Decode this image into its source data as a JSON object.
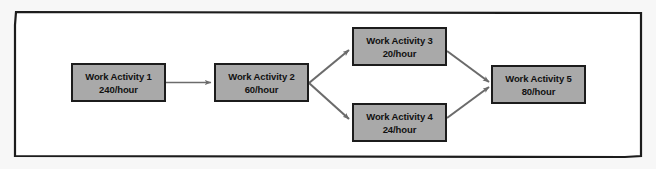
{
  "diagram": {
    "frame": {
      "shape": "chamfered-rectangle",
      "border_color": "#1c1c1c",
      "background_color": "#ffffff",
      "page_background_color": "#f7f7f7"
    },
    "style": {
      "node_fill": "#a9a9a9",
      "node_border": "#1c1c1c",
      "node_text_color": "#111111",
      "arrow_color": "#6b6b6b"
    },
    "nodes": [
      {
        "id": "work-activity-1",
        "title": "Work Activity 1",
        "rate": "240/hour",
        "rate_value": 240,
        "rate_unit": "per hour"
      },
      {
        "id": "work-activity-2",
        "title": "Work Activity 2",
        "rate": "60/hour",
        "rate_value": 60,
        "rate_unit": "per hour"
      },
      {
        "id": "work-activity-3",
        "title": "Work Activity 3",
        "rate": "20/hour",
        "rate_value": 20,
        "rate_unit": "per hour"
      },
      {
        "id": "work-activity-4",
        "title": "Work Activity 4",
        "rate": "24/hour",
        "rate_value": 24,
        "rate_unit": "per hour"
      },
      {
        "id": "work-activity-5",
        "title": "Work Activity 5",
        "rate": "80/hour",
        "rate_value": 80,
        "rate_unit": "per hour"
      }
    ],
    "connections": [
      {
        "from": "work-activity-1",
        "to": "work-activity-2"
      },
      {
        "from": "work-activity-2",
        "to": "work-activity-3"
      },
      {
        "from": "work-activity-2",
        "to": "work-activity-4"
      },
      {
        "from": "work-activity-3",
        "to": "work-activity-5"
      },
      {
        "from": "work-activity-4",
        "to": "work-activity-5"
      }
    ]
  }
}
